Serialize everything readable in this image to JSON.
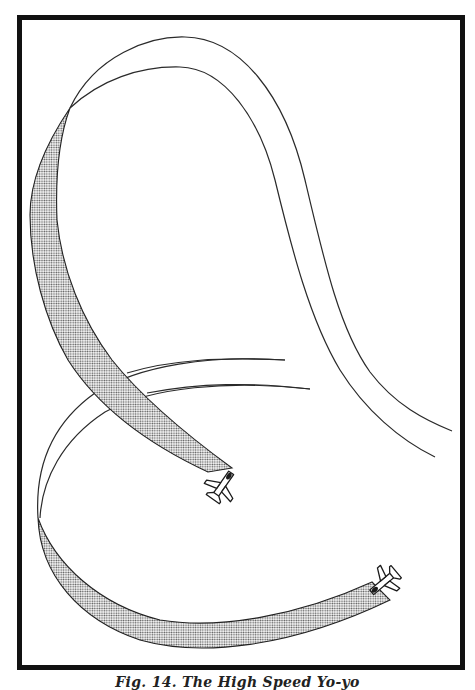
{
  "figure": {
    "caption": "Fig. 14. The High Speed Yo-yo",
    "elements": {
      "upper_ribbon": "shaded-flight-path-attacker",
      "lower_ribbon": "shaded-flight-path-defender",
      "upper_loop": "thin-outline-flight-path-loop",
      "lower_loop": "thin-outline-flight-path-loop",
      "aircraft": [
        "attacker-jet",
        "defender-jet"
      ]
    },
    "colors": {
      "ink": "#222222",
      "frame": "#111111",
      "paper": "#ffffff",
      "halftone": "#555555"
    }
  }
}
